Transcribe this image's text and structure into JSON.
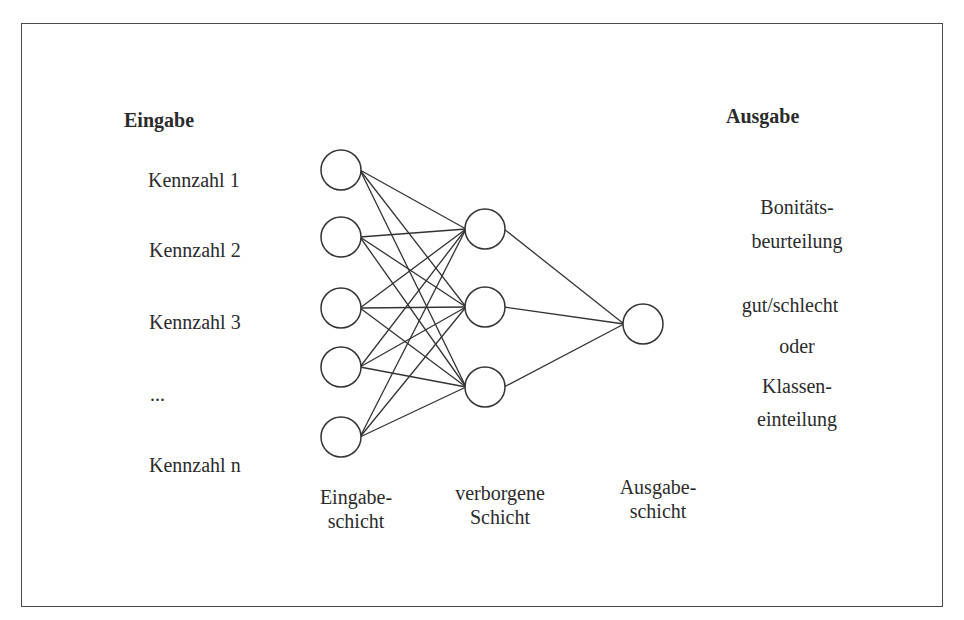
{
  "diagram": {
    "type": "neural-network",
    "input_heading": "Eingabe",
    "output_heading": "Ausgabe",
    "inputs": [
      {
        "label": "Kennzahl 1"
      },
      {
        "label": "Kennzahl 2"
      },
      {
        "label": "Kennzahl 3"
      },
      {
        "label": "..."
      },
      {
        "label": "Kennzahl n"
      }
    ],
    "output_description": {
      "line1": "Bonitäts-",
      "line2": "beurteilung",
      "line3": "gut/schlecht",
      "line4": "oder",
      "line5": "Klassen-",
      "line6": "einteilung"
    },
    "layer_labels": {
      "input": {
        "line1": "Eingabe-",
        "line2": "schicht"
      },
      "hidden": {
        "line1": "verborgene",
        "line2": "Schicht"
      },
      "output": {
        "line1": "Ausgabe-",
        "line2": "schicht"
      }
    },
    "layers": {
      "input_nodes": 5,
      "hidden_nodes": 3,
      "output_nodes": 1
    },
    "colors": {
      "stroke": "#333333",
      "frame": "#4a4a4a",
      "background": "#ffffff"
    }
  }
}
